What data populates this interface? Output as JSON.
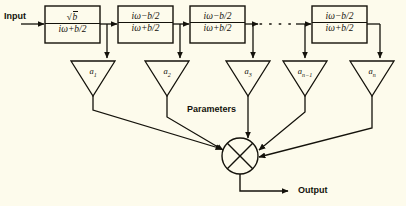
{
  "figure": {
    "background_color": "#fdfbec",
    "line_color": "#14120b"
  },
  "labels": {
    "input": "Input",
    "output": "Output",
    "parameters": "Parameters"
  },
  "blocks": [
    {
      "id": "block-1",
      "numerator": "√b",
      "denominator": "iω+b/2",
      "x": 45,
      "y": 6,
      "w": 55,
      "h": 37
    },
    {
      "id": "block-2",
      "numerator": "iω−b/2",
      "denominator": "iω+b/2",
      "x": 118,
      "y": 6,
      "w": 55,
      "h": 37
    },
    {
      "id": "block-3",
      "numerator": "iω−b/2",
      "denominator": "iω+b/2",
      "x": 190,
      "y": 6,
      "w": 55,
      "h": 37
    },
    {
      "id": "block-4",
      "numerator": "iω−b/2",
      "denominator": "iω+b/2",
      "x": 312,
      "y": 6,
      "w": 55,
      "h": 37
    }
  ],
  "gains": [
    {
      "id": "gain-1",
      "label": "a",
      "subscript": "1",
      "cx": 93,
      "top": 62,
      "half_width": 22
    },
    {
      "id": "gain-2",
      "label": "a",
      "subscript": "2",
      "cx": 167,
      "top": 62,
      "half_width": 22
    },
    {
      "id": "gain-3",
      "label": "a",
      "subscript": "3",
      "cx": 248,
      "top": 62,
      "half_width": 22
    },
    {
      "id": "gain-4",
      "label": "a",
      "subscript": "n−1",
      "cx": 305,
      "top": 62,
      "half_width": 22
    },
    {
      "id": "gain-5",
      "label": "a",
      "subscript": "n",
      "cx": 372,
      "top": 62,
      "half_width": 22
    }
  ],
  "summing_node": {
    "cx": 240,
    "cy": 156,
    "r": 18,
    "symbol": "x-cross"
  },
  "ellipsis": {
    "dots": 5,
    "x_start": 256,
    "x_end": 296,
    "y": 24
  }
}
